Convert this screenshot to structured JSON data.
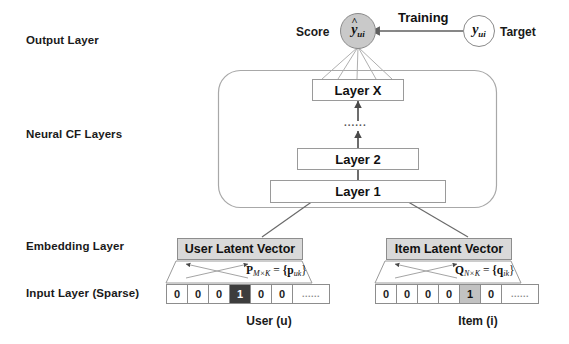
{
  "diagram": {
    "row_labels": [
      {
        "id": "output-layer",
        "text": "Output Layer"
      },
      {
        "id": "neural-cf-layers",
        "text": "Neural CF Layers"
      },
      {
        "id": "embedding-layer",
        "text": "Embedding Layer"
      },
      {
        "id": "input-layer",
        "text": "Input Layer (Sparse)"
      }
    ],
    "output": {
      "score_label": "Score",
      "score_node": {
        "base": "y",
        "hat": "^",
        "sub": "ui"
      },
      "training_label": "Training",
      "target_node": {
        "base": "y",
        "sub": "ui"
      },
      "target_label": "Target"
    },
    "neural_layers": [
      {
        "id": "layer-x",
        "label": "Layer X"
      },
      {
        "id": "layer-dots",
        "label": "......"
      },
      {
        "id": "layer-2",
        "label": "Layer 2"
      },
      {
        "id": "layer-1",
        "label": "Layer 1"
      }
    ],
    "embedding": {
      "user": {
        "box_label": "User Latent Vector",
        "matrix_symbol": "P",
        "matrix_dims": "M×K",
        "matrix_equals": "=",
        "matrix_entries": "{p",
        "matrix_entry_sub": "uk",
        "matrix_entries_close": "}"
      },
      "item": {
        "box_label": "Item Latent Vector",
        "matrix_symbol": "Q",
        "matrix_dims": "N×K",
        "matrix_equals": "=",
        "matrix_entries": "{q",
        "matrix_entry_sub": "ik",
        "matrix_entries_close": "}"
      }
    },
    "input": {
      "user": {
        "cells": [
          "0",
          "0",
          "0",
          "1",
          "0",
          "0",
          "......"
        ],
        "hot_index": 3,
        "hot_style": "dark",
        "caption": "User (u)"
      },
      "item": {
        "cells": [
          "0",
          "0",
          "0",
          "0",
          "1",
          "0",
          "......"
        ],
        "hot_index": 4,
        "hot_style": "gray",
        "caption": "Item (i)"
      }
    },
    "colors": {
      "background": "#ffffff",
      "line": "#6f6f6f",
      "box_border": "#9a9a9a",
      "latent_fill": "#d9d9d9",
      "score_fill": "#c9c9c9",
      "target_fill": "#ffffff",
      "hot_dark": "#3d3d3d",
      "hot_gray": "#c2c2c2",
      "text": "#1a1a1a"
    }
  }
}
